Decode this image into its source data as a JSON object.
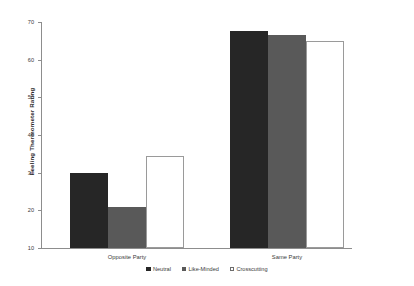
{
  "chart_data": {
    "type": "bar",
    "title": "",
    "subtitle": "",
    "xlabel": "",
    "ylabel": "Feeling Thermometer Rating",
    "categories": [
      "Opposite Party",
      "Same Party"
    ],
    "series": [
      {
        "name": "Neutral",
        "color": "#262626",
        "values": [
          30,
          67.5
        ]
      },
      {
        "name": "Like-Minded",
        "color": "#595959",
        "values": [
          21,
          66.5
        ]
      },
      {
        "name": "Crosscutting",
        "color": "#ffffff",
        "values": [
          34.5,
          65
        ]
      }
    ],
    "ylim": [
      10,
      70
    ],
    "yticks": [
      10,
      20,
      30,
      40,
      50,
      60,
      70
    ],
    "ytick_labels": [
      "10",
      "20",
      "30",
      "40",
      "50",
      "60",
      "70"
    ],
    "grid": false,
    "legend_position": "bottom",
    "annotations": []
  },
  "axis": {
    "y_title": "Feeling Thermometer Rating"
  },
  "legend": {
    "items": [
      {
        "label": "Neutral"
      },
      {
        "label": "Like-Minded"
      },
      {
        "label": "Crosscutting"
      }
    ]
  }
}
